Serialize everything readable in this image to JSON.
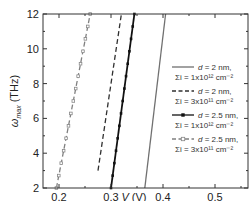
{
  "chart_data": {
    "type": "line",
    "title": "",
    "xlabel": "V (V)",
    "ylabel": "ω_max (THz)",
    "xlim": [
      0.17,
      0.56
    ],
    "ylim": [
      2,
      12
    ],
    "xticks": [
      0.2,
      0.3,
      0.4,
      0.5
    ],
    "xtick_labels": [
      "0.2",
      "0.3",
      "0.4",
      "0.5"
    ],
    "yticks": [
      2,
      4,
      6,
      8,
      10,
      12
    ],
    "ytick_labels": [
      "2",
      "4",
      "6",
      "8",
      "10",
      "12"
    ],
    "grid": false,
    "legend_position": "lower right",
    "series": [
      {
        "name": "d = 2 nm, Σi = 1x10^12 cm^-2",
        "legend_line1": "d = 2 nm,",
        "legend_line2": "Σi = 1x10¹² cm⁻²",
        "style": "solid",
        "marker": "none",
        "color": "#707070",
        "x": [
          0.365,
          0.405
        ],
        "y": [
          2,
          12
        ]
      },
      {
        "name": "d = 2 nm, Σi = 3x10^11 cm^-2",
        "legend_line1": "d = 2 nm,",
        "legend_line2": "Σi = 3x10¹¹ cm⁻²",
        "style": "dashed",
        "marker": "none",
        "color": "#303030",
        "x": [
          0.275,
          0.32
        ],
        "y": [
          3,
          12
        ]
      },
      {
        "name": "d = 2.5 nm, Σi = 1x10^12 cm^-2",
        "legend_line1": "d = 2.5 nm,",
        "legend_line2": "Σi = 1x10¹² cm⁻²",
        "style": "solid",
        "marker": "filled-square",
        "color": "#111111",
        "x": [
          0.3,
          0.345
        ],
        "y": [
          2,
          12
        ]
      },
      {
        "name": "d = 2.5 nm, Σi = 3x10^11 cm^-2",
        "legend_line1": "d = 2.5 nm,",
        "legend_line2": "Σi = 3x10¹¹ cm⁻²",
        "style": "dashed",
        "marker": "open-square",
        "color": "#808080",
        "x": [
          0.195,
          0.26
        ],
        "y": [
          2,
          12
        ]
      }
    ]
  },
  "axes": {
    "x_label_italic": "V",
    "x_label_unit": " (V)",
    "y_label_symbol": "ω",
    "y_label_sub": "max",
    "y_label_unit": " (THz)"
  }
}
